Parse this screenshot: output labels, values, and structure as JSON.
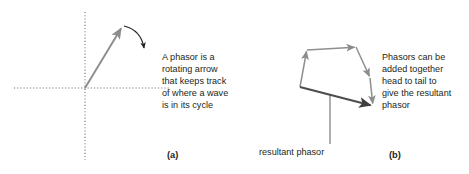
{
  "figure": {
    "width": 469,
    "height": 174,
    "background": "#ffffff",
    "ink_color": "#231f20",
    "phasor_color": "#8c8c8c",
    "resultant_color": "#4d4d4d"
  },
  "panel_a": {
    "caption": "(a)",
    "description_lines": [
      "A phasor is a",
      "rotating arrow",
      "that keeps track",
      "of where a wave",
      "is in its cycle"
    ],
    "axes": {
      "style": "dotted",
      "origin": [
        85,
        88
      ],
      "horizontal": [
        14,
        170
      ],
      "vertical": [
        12,
        160
      ]
    },
    "phasor_arrow": {
      "from": [
        85,
        88
      ],
      "to": [
        122,
        27
      ],
      "color": "#8c8c8c"
    },
    "rotation_arrow": {
      "from": [
        124,
        26
      ],
      "to": [
        146,
        51
      ],
      "color": "#231f20",
      "direction": "clockwise"
    }
  },
  "panel_b": {
    "caption": "(b)",
    "description_lines": [
      "Phasors can be",
      "added together",
      "head to tail to",
      "give the resultant",
      "phasor"
    ],
    "resultant_label": "resultant phasor",
    "component_vectors": [
      {
        "from": [
          300,
          87
        ],
        "to": [
          307,
          50
        ]
      },
      {
        "from": [
          307,
          50
        ],
        "to": [
          356,
          47
        ]
      },
      {
        "from": [
          356,
          47
        ],
        "to": [
          370,
          78
        ]
      },
      {
        "from": [
          370,
          78
        ],
        "to": [
          373,
          105
        ]
      }
    ],
    "resultant_vector": {
      "from": [
        300,
        87
      ],
      "to": [
        373,
        106
      ]
    },
    "leader_line": {
      "from": [
        330,
        96
      ],
      "to": [
        330,
        144
      ]
    }
  }
}
